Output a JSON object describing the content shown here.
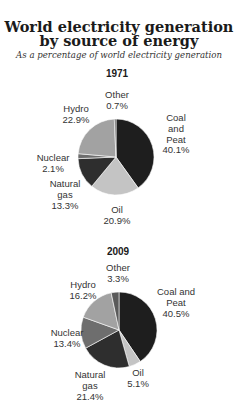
{
  "title_line1": "World electricity generation",
  "title_line2": "by source of energy",
  "subtitle": "As a percentage of world electricity generation",
  "chart_data": [
    {
      "type": "pie",
      "title": "1971",
      "unit": "%",
      "slices": [
        {
          "name": "Coal and Peat",
          "label_lines": [
            "Coal",
            "and",
            "Peat",
            "40.1%"
          ],
          "value": 40.1,
          "color": "#1e1e1e"
        },
        {
          "name": "Oil",
          "label_lines": [
            "Oil",
            "20.9%"
          ],
          "value": 20.9,
          "color": "#c4c4c4"
        },
        {
          "name": "Natural gas",
          "label_lines": [
            "Natural",
            "gas",
            "13.3%"
          ],
          "value": 13.3,
          "color": "#2e2e2e"
        },
        {
          "name": "Nuclear",
          "label_lines": [
            "Nuclear",
            "2.1%"
          ],
          "value": 2.1,
          "color": "#6e6e6e"
        },
        {
          "name": "Hydro",
          "label_lines": [
            "Hydro",
            "22.9%"
          ],
          "value": 22.9,
          "color": "#a2a2a2"
        },
        {
          "name": "Other",
          "label_lines": [
            "Other",
            "0.7%"
          ],
          "value": 0.7,
          "color": "#5a5a5a"
        }
      ]
    },
    {
      "type": "pie",
      "title": "2009",
      "unit": "%",
      "slices": [
        {
          "name": "Coal and Peat",
          "label_lines": [
            "Coal and",
            "Peat",
            "40.5%"
          ],
          "value": 40.5,
          "color": "#1e1e1e"
        },
        {
          "name": "Oil",
          "label_lines": [
            "Oil",
            "5.1%"
          ],
          "value": 5.1,
          "color": "#c4c4c4"
        },
        {
          "name": "Natural gas",
          "label_lines": [
            "Natural",
            "gas",
            "21.4%"
          ],
          "value": 21.4,
          "color": "#2e2e2e"
        },
        {
          "name": "Nuclear",
          "label_lines": [
            "Nuclear",
            "13.4%"
          ],
          "value": 13.4,
          "color": "#6e6e6e"
        },
        {
          "name": "Hydro",
          "label_lines": [
            "Hydro",
            "16.2%"
          ],
          "value": 16.2,
          "color": "#a2a2a2"
        },
        {
          "name": "Other",
          "label_lines": [
            "Other",
            "3.3%"
          ],
          "value": 3.3,
          "color": "#5a5a5a"
        }
      ]
    }
  ]
}
